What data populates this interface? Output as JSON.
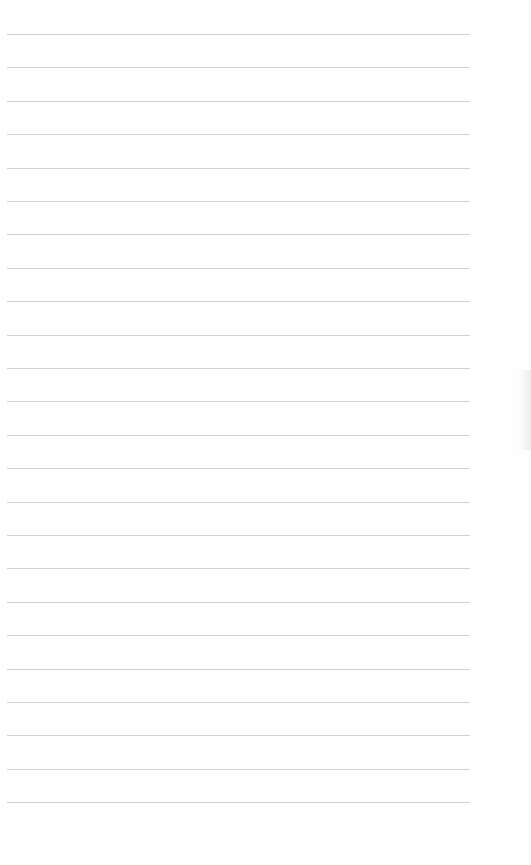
{
  "page": {
    "type": "ruled-paper",
    "background_color": "#fefefe",
    "rule_color": "#c9c9c9",
    "rule_count": 24,
    "first_rule_y": 34,
    "rule_spacing": 33.4,
    "rule_left": 7,
    "rule_right": 470
  }
}
